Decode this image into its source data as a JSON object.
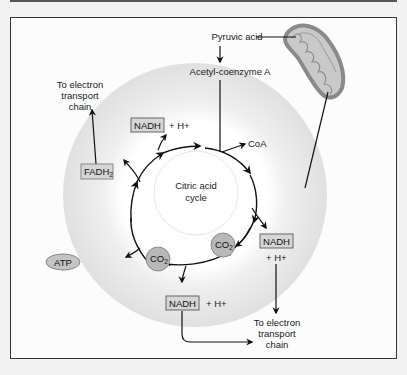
{
  "diagram": {
    "center_label_line1": "Citric acid",
    "center_label_line2": "cycle",
    "inputs": {
      "pyruvic_acid": "Pyruvic acid",
      "acetyl_coa": "Acetyl-coenzyme A"
    },
    "byproducts": {
      "coa": "CoA",
      "atp": "ATP",
      "fadh2_main": "FADH",
      "fadh2_sub": "2",
      "co2_main": "CO",
      "co2_sub": "2",
      "nadh": "NADH",
      "h_plus": "+ H+"
    },
    "destinations": {
      "etc_line1": "To electron",
      "etc_line2": "transport",
      "etc_line3": "chain"
    },
    "colors": {
      "outer_ring": "#e2e2e2",
      "inner_circle": "#ffffff",
      "box_fill": "#d6d6d6",
      "co2_fill": "#b8b8b8",
      "atp_fill": "#c4c4c4",
      "mito_outer": "#8a8a8a",
      "mito_inner": "#c9c9c9",
      "arrow": "#111111"
    }
  }
}
